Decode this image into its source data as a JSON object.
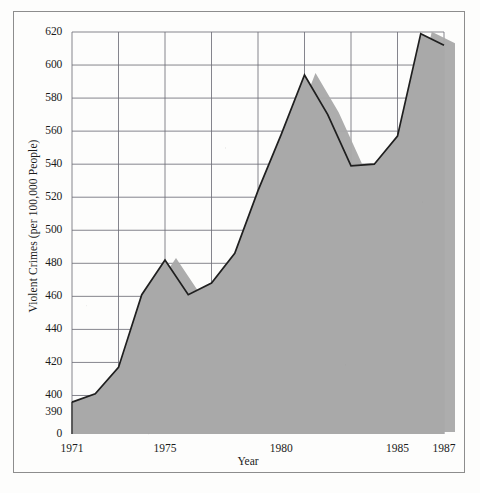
{
  "chart_data": {
    "type": "area",
    "title": "",
    "xlabel": "Year",
    "ylabel": "Violent Crimes (per 100,000 People)",
    "x": [
      1971,
      1972,
      1973,
      1974,
      1975,
      1976,
      1977,
      1978,
      1979,
      1980,
      1981,
      1982,
      1983,
      1984,
      1985,
      1986,
      1987
    ],
    "values": [
      396,
      401,
      417,
      461,
      482,
      461,
      468,
      486,
      524,
      558,
      594,
      570,
      539,
      540,
      557,
      619,
      612
    ],
    "series": [
      {
        "name": "Violent Crimes (per 100,000 People)",
        "values": [
          396,
          401,
          417,
          461,
          482,
          461,
          468,
          486,
          524,
          558,
          594,
          570,
          539,
          540,
          557,
          619,
          612
        ]
      }
    ],
    "xlim": [
      1971,
      1987
    ],
    "ylim": [
      390,
      620
    ],
    "y_axis_break_value": "0",
    "y_major_step": 20,
    "y_minor_step": 10,
    "x_tick_step": 1,
    "x_gridline_step": 2,
    "grid": true,
    "legend": "none",
    "fill_color": "#a9a9a9",
    "line_color": "#1f1f1f",
    "grid_color": "#6f6f78",
    "background_color": "#fdfdfc",
    "ytick_labels": [
      "620",
      "600",
      "580",
      "560",
      "540",
      "520",
      "500",
      "480",
      "460",
      "440",
      "420",
      "400",
      "390",
      "0"
    ],
    "ytick_values": [
      620,
      600,
      580,
      560,
      540,
      520,
      500,
      480,
      460,
      440,
      420,
      400,
      390,
      0
    ],
    "xtick_labels": [
      "1971",
      "1975",
      "1980",
      "1985",
      "1987"
    ],
    "xtick_values": [
      1971,
      1975,
      1980,
      1985,
      1987
    ]
  },
  "figure": {
    "frame_color": "#8d8d8d",
    "axis_color": "#1f1f1f"
  }
}
